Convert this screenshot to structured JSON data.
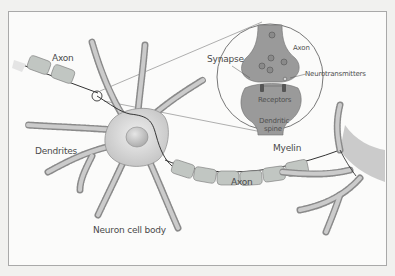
{
  "diagram": {
    "labels": {
      "axon_left": "Axon",
      "dendrites": "Dendrites",
      "neuron_cell_body": "Neuron cell body",
      "myelin": "Myelin",
      "axon_bottom": "Axon",
      "synapse": "Synapse",
      "synapse_axon": "Axon",
      "neurotransmitters": "Neurotransmitters",
      "receptors": "Receptors",
      "dendritic_spine_line1": "Dendritic",
      "dendritic_spine_line2": "spine"
    },
    "colors": {
      "body_fill": "#c9c9c9",
      "myelin_fill": "#b8bdb9",
      "synapse_fill": "#9a9a9a",
      "outline": "#707070",
      "frame_border": "#a9a9a9",
      "background": "#f1f1ef"
    }
  }
}
